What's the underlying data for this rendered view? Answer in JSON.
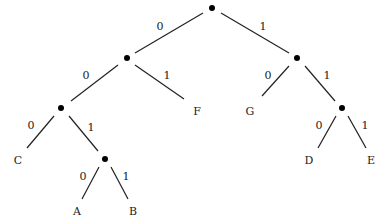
{
  "diagram": {
    "type": "binary-tree",
    "nodes": [
      {
        "id": "root",
        "x": 212,
        "y": 8,
        "kind": "internal"
      },
      {
        "id": "n0",
        "x": 127,
        "y": 58,
        "kind": "internal"
      },
      {
        "id": "n1",
        "x": 297,
        "y": 58,
        "kind": "internal"
      },
      {
        "id": "n00",
        "x": 61,
        "y": 108,
        "kind": "internal"
      },
      {
        "id": "n11",
        "x": 342,
        "y": 108,
        "kind": "internal"
      },
      {
        "id": "n001",
        "x": 105,
        "y": 159,
        "kind": "internal"
      }
    ],
    "leaves": [
      {
        "id": "F",
        "label": "F",
        "x": 197,
        "y": 112
      },
      {
        "id": "G",
        "label": "G",
        "x": 250,
        "y": 112
      },
      {
        "id": "C",
        "label": "C",
        "x": 18,
        "y": 161
      },
      {
        "id": "D",
        "label": "D",
        "x": 309,
        "y": 161
      },
      {
        "id": "E",
        "label": "E",
        "x": 371,
        "y": 161
      },
      {
        "id": "A",
        "label": "A",
        "x": 77,
        "y": 212
      },
      {
        "id": "B",
        "label": "B",
        "x": 133,
        "y": 212
      }
    ],
    "edges": [
      {
        "x1": 203,
        "y1": 13,
        "x2": 135,
        "y2": 53,
        "bit": "0",
        "lx": 160,
        "ly": 27
      },
      {
        "x1": 221,
        "y1": 13,
        "x2": 289,
        "y2": 53,
        "bit": "1",
        "lx": 263,
        "ly": 27
      },
      {
        "x1": 118,
        "y1": 65,
        "x2": 71,
        "y2": 101,
        "bit": "0",
        "lx": 86,
        "ly": 76
      },
      {
        "x1": 135,
        "y1": 65,
        "x2": 184,
        "y2": 99,
        "bit": "1",
        "lx": 167,
        "ly": 76
      },
      {
        "x1": 289,
        "y1": 66,
        "x2": 262,
        "y2": 96,
        "bit": "0",
        "lx": 268,
        "ly": 76
      },
      {
        "x1": 305,
        "y1": 66,
        "x2": 335,
        "y2": 101,
        "bit": "1",
        "lx": 327,
        "ly": 76
      },
      {
        "x1": 54,
        "y1": 116,
        "x2": 27,
        "y2": 148,
        "bit": "0",
        "lx": 31,
        "ly": 126
      },
      {
        "x1": 69,
        "y1": 116,
        "x2": 98,
        "y2": 151,
        "bit": "1",
        "lx": 91,
        "ly": 128
      },
      {
        "x1": 99,
        "y1": 167,
        "x2": 82,
        "y2": 199,
        "bit": "0",
        "lx": 83,
        "ly": 177
      },
      {
        "x1": 111,
        "y1": 167,
        "x2": 128,
        "y2": 199,
        "bit": "1",
        "lx": 126,
        "ly": 177
      },
      {
        "x1": 336,
        "y1": 116,
        "x2": 318,
        "y2": 148,
        "bit": "0",
        "lx": 319,
        "ly": 126
      },
      {
        "x1": 348,
        "y1": 116,
        "x2": 366,
        "y2": 148,
        "bit": "1",
        "lx": 365,
        "ly": 126
      }
    ]
  }
}
